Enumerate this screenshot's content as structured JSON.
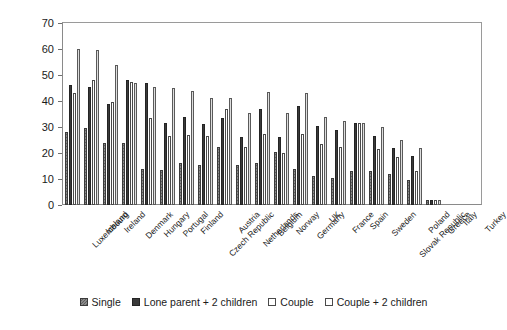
{
  "chart_data": {
    "type": "bar",
    "title": "",
    "xlabel": "",
    "ylabel": "",
    "ylim": [
      0,
      70
    ],
    "yticks": [
      0,
      10,
      20,
      30,
      40,
      50,
      60,
      70
    ],
    "grid": false,
    "legend_position": "bottom",
    "categories": [
      "Luxembourg",
      "Iceland",
      "Ireland",
      "Denmark",
      "Hungary",
      "Portugal",
      "Finland",
      "Czech Republic",
      "Austria",
      "Netherlands",
      "Belgium",
      "Norway",
      "Germany",
      "UK",
      "France",
      "Spain",
      "Sweden",
      "Slovak Republic",
      "Poland",
      "Greece",
      "Italy",
      "Turkey"
    ],
    "series": [
      {
        "name": "Single",
        "color": "#6e6e6e",
        "values": [
          28,
          29.5,
          24,
          24,
          14,
          13.5,
          16,
          15.5,
          22.5,
          15.5,
          16,
          20.5,
          14,
          11,
          10.5,
          13,
          13,
          12,
          9.5,
          2,
          0,
          0
        ]
      },
      {
        "name": "Lone parent + 2 children",
        "color": "#3a3a3a",
        "values": [
          46,
          45.5,
          39,
          48,
          47,
          31.5,
          34,
          31,
          33.5,
          26,
          37,
          26,
          38,
          30.5,
          29,
          31.5,
          26.5,
          22,
          19,
          2,
          0,
          0
        ]
      },
      {
        "name": "Couple",
        "color": "#ffffff",
        "values": [
          43,
          48,
          39.5,
          47.5,
          33.5,
          26.5,
          27,
          26.5,
          37,
          22.5,
          27.5,
          20,
          27.5,
          23.5,
          22.5,
          31.5,
          21.5,
          18.5,
          13,
          2,
          0,
          0
        ]
      },
      {
        "name": "Couple + 2 children",
        "color": "#dedede",
        "values": [
          60,
          59.5,
          54,
          47,
          45.5,
          45,
          44,
          41,
          41,
          35.5,
          43.5,
          35.5,
          43,
          34,
          32.5,
          31.5,
          30,
          25,
          22,
          2,
          0,
          0
        ]
      }
    ]
  },
  "legend": {
    "items": [
      {
        "label": "Single",
        "swatch": "hatched-grey-swatch"
      },
      {
        "label": "Lone parent + 2 children",
        "swatch": "solid-dark-swatch"
      },
      {
        "label": "Couple",
        "swatch": "white-outline-swatch"
      },
      {
        "label": "Couple + 2 children",
        "swatch": "light-grey-swatch"
      }
    ]
  }
}
